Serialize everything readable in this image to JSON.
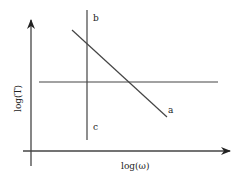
{
  "diagram": {
    "type": "log-log sketch",
    "axes": {
      "x_label": "log(ω)",
      "y_label": "log(T)"
    },
    "lines": [
      {
        "id": "a",
        "label": "a",
        "kind": "sloped-descending"
      },
      {
        "id": "b-c",
        "label_top": "b",
        "label_bottom": "c",
        "kind": "vertical"
      },
      {
        "id": "horizontal",
        "label": "",
        "kind": "horizontal"
      }
    ],
    "colors": {
      "stroke": "#333333",
      "background": "#ffffff"
    }
  }
}
